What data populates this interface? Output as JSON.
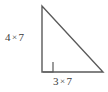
{
  "figure": {
    "name": "right-triangle-dimension-diagram",
    "shape": "right triangle",
    "background_color": "#ffffff",
    "stroke_color": "#5a5a5a",
    "text_color": "#3b3b3b"
  },
  "labels": {
    "vertical_leg": {
      "full_text": "4 × 7",
      "factor_a": "4",
      "operator": "×",
      "factor_b": "7"
    },
    "horizontal_leg": {
      "full_text": "3 × 7",
      "factor_a": "3",
      "operator": "×",
      "factor_b": "7"
    }
  },
  "geometry": {
    "apex": [
      42,
      6
    ],
    "right_angle_vertex": [
      42,
      72
    ],
    "bottom_right_vertex": [
      103,
      72
    ],
    "right_angle_marker_size": 10
  }
}
